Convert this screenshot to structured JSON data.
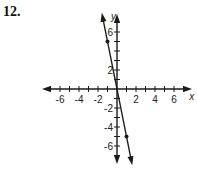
{
  "problem_number": "12.",
  "chart_data": {
    "type": "line",
    "title": "",
    "xlabel": "x",
    "ylabel": "y",
    "xlim": [
      -7.5,
      7.5
    ],
    "ylim": [
      -7.5,
      7.5
    ],
    "grid": false,
    "x_tick_labels": [
      "-6",
      "-4",
      "-2",
      "2",
      "4",
      "6"
    ],
    "y_tick_labels": [
      "6",
      "2",
      "-2",
      "-4",
      "-6"
    ],
    "series": [
      {
        "name": "line",
        "equation": "y = -5x",
        "points": [
          [
            -1,
            5
          ],
          [
            1,
            -5
          ]
        ],
        "x": [
          -1.5,
          1.5
        ],
        "y": [
          7.5,
          -7.5
        ]
      }
    ]
  }
}
